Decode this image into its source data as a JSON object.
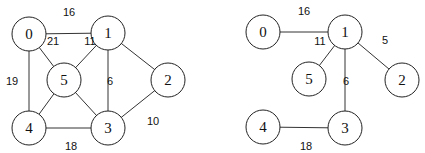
{
  "graphs": [
    {
      "name": "original-graph",
      "nodes": [
        {
          "id": "0",
          "label": "0",
          "x": 29,
          "y": 34
        },
        {
          "id": "1",
          "label": "1",
          "x": 108,
          "y": 33
        },
        {
          "id": "2",
          "label": "2",
          "x": 168,
          "y": 80
        },
        {
          "id": "3",
          "label": "3",
          "x": 108,
          "y": 128
        },
        {
          "id": "4",
          "label": "4",
          "x": 29,
          "y": 128
        },
        {
          "id": "5",
          "label": "5",
          "x": 64,
          "y": 80
        }
      ],
      "edges": [
        {
          "from": "0",
          "to": "1",
          "weight": "16",
          "lx": 69,
          "ly": 12
        },
        {
          "from": "0",
          "to": "5",
          "weight": "21",
          "lx": 53,
          "ly": 41
        },
        {
          "from": "0",
          "to": "4",
          "weight": "19",
          "lx": 12,
          "ly": 81
        },
        {
          "from": "1",
          "to": "5",
          "weight": "11",
          "lx": 90,
          "ly": 41
        },
        {
          "from": "1",
          "to": "3",
          "weight": "6",
          "lx": 110,
          "ly": 81
        },
        {
          "from": "1",
          "to": "2",
          "weight": "",
          "lx": 0,
          "ly": 0
        },
        {
          "from": "5",
          "to": "4",
          "weight": "",
          "lx": 0,
          "ly": 0
        },
        {
          "from": "5",
          "to": "3",
          "weight": "",
          "lx": 0,
          "ly": 0
        },
        {
          "from": "2",
          "to": "3",
          "weight": "10",
          "lx": 153,
          "ly": 121
        },
        {
          "from": "4",
          "to": "3",
          "weight": "18",
          "lx": 71,
          "ly": 146
        }
      ]
    },
    {
      "name": "spanning-tree",
      "nodes": [
        {
          "id": "0",
          "label": "0",
          "x": 263,
          "y": 32
        },
        {
          "id": "1",
          "label": "1",
          "x": 345,
          "y": 32
        },
        {
          "id": "2",
          "label": "2",
          "x": 402,
          "y": 80
        },
        {
          "id": "3",
          "label": "3",
          "x": 345,
          "y": 128
        },
        {
          "id": "4",
          "label": "4",
          "x": 263,
          "y": 127
        },
        {
          "id": "5",
          "label": "5",
          "x": 309,
          "y": 79
        }
      ],
      "edges": [
        {
          "from": "0",
          "to": "1",
          "weight": "16",
          "lx": 304,
          "ly": 11
        },
        {
          "from": "1",
          "to": "5",
          "weight": "11",
          "lx": 320,
          "ly": 41
        },
        {
          "from": "1",
          "to": "2",
          "weight": "5",
          "lx": 385,
          "ly": 40
        },
        {
          "from": "1",
          "to": "3",
          "weight": "6",
          "lx": 346,
          "ly": 81
        },
        {
          "from": "4",
          "to": "3",
          "weight": "18",
          "lx": 306,
          "ly": 146
        }
      ]
    }
  ],
  "style": {
    "node_radius": 17,
    "edge_color": "#333333",
    "node_stroke": "#222222",
    "background": "#ffffff"
  }
}
